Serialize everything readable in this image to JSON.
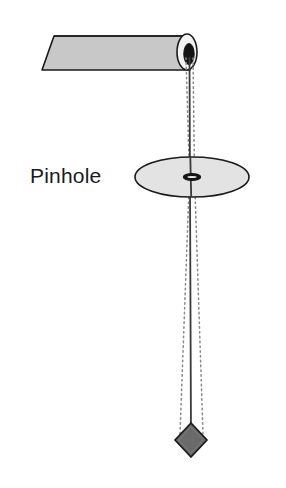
{
  "figure": {
    "width": 286,
    "height": 488,
    "background_color": "#ffffff"
  },
  "labels": {
    "pinhole": "Pinhole"
  },
  "colors": {
    "paper_roll_fill": "#c8c8c8",
    "paper_roll_stroke": "#1a1a1a",
    "roll_end_fill": "#f2f2f2",
    "roll_hole_fill": "#141414",
    "disc_fill": "#e3e3e3",
    "disc_stroke": "#1a1a1a",
    "pinhole_fill": "#141414",
    "string_stroke": "#3a3a3a",
    "ray_stroke": "#8a8a8a",
    "bob_fill": "#6a6a6a",
    "bob_stroke": "#1a1a1a",
    "label_color": "#1a1a1a"
  },
  "geometry": {
    "roll": {
      "top_left_x": 54,
      "top_y": 36,
      "bottom_left_x": 42,
      "bottom_y": 70,
      "right_x": 190,
      "end_center_x": 190,
      "end_center_y": 52,
      "end_rx": 9,
      "end_ry": 18,
      "hole_rx": 5,
      "hole_ry": 10
    },
    "disc": {
      "center_x": 192,
      "center_y": 177,
      "rx": 57,
      "ry": 20
    },
    "pinhole": {
      "center_x": 192,
      "center_y": 177,
      "rx": 8,
      "ry": 3
    },
    "string": {
      "top_x": 190,
      "top_y": 60,
      "bottom_x": 191,
      "bottom_y": 438
    },
    "rays": {
      "apex_top_x": 189,
      "apex_top_y": 57,
      "pinhole_x": 192,
      "pinhole_y": 177,
      "bob_x": 191,
      "bob_y": 436,
      "top_half_spread": 3,
      "bottom_half_spread": 11
    },
    "bob": {
      "center_x": 191,
      "center_y": 440,
      "half_width": 16,
      "half_height": 17
    }
  },
  "elements": [
    {
      "name": "paper-roll",
      "type": "shape",
      "description": "rolled sheet of paper shown in perspective"
    },
    {
      "name": "roll-hole",
      "type": "shape",
      "description": "dark opening at the end of the roll"
    },
    {
      "name": "pinhole-disc",
      "type": "shape",
      "description": "horizontal card with a pinhole"
    },
    {
      "name": "pinhole-aperture",
      "type": "shape",
      "description": "small hole at the disc centre"
    },
    {
      "name": "plumb-string",
      "type": "line",
      "description": "vertical string from roll to bob"
    },
    {
      "name": "light-ray-left",
      "type": "line",
      "description": "dotted ray left of the string"
    },
    {
      "name": "light-ray-right",
      "type": "line",
      "description": "dotted ray right of the string"
    },
    {
      "name": "plumb-bob",
      "type": "shape",
      "description": "diamond shaped weight at the bottom"
    }
  ]
}
